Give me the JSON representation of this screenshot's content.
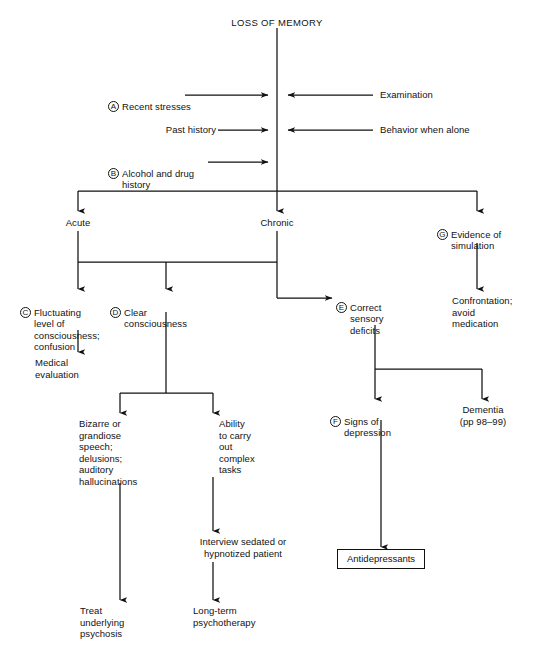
{
  "diagram": {
    "title": "LOSS OF MEMORY",
    "type": "clinical-decision-flowchart",
    "nodes": {
      "root": {
        "label": "LOSS OF MEMORY"
      },
      "a_recent_stresses": {
        "key": "A",
        "label": "Recent stresses"
      },
      "examination": {
        "label": "Examination"
      },
      "past_history": {
        "label": "Past history"
      },
      "behavior_when_alone": {
        "label": "Behavior when alone"
      },
      "b_alcohol_drug": {
        "key": "B",
        "label": "Alcohol and drug\nhistory"
      },
      "acute": {
        "label": "Acute"
      },
      "chronic": {
        "label": "Chronic"
      },
      "g_simulation": {
        "key": "G",
        "label": "Evidence of\nsimulation"
      },
      "confrontation": {
        "label": "Confrontation;\navoid\nmedication"
      },
      "c_fluctuating": {
        "key": "C",
        "label": "Fluctuating\nlevel of\nconsciousness;\nconfusion"
      },
      "medical_evaluation": {
        "label": "Medical\nevaluation"
      },
      "d_clear_consciousness": {
        "key": "D",
        "label": "Clear\nconsciousness"
      },
      "e_correct_sensory": {
        "key": "E",
        "label": "Correct\nsensory\ndeficits"
      },
      "bizarre_speech": {
        "label": "Bizarre or\ngrandiose\nspeech;\ndelusions;\nauditory\nhallucinations"
      },
      "ability_complex_tasks": {
        "label": "Ability\nto carry\nout\ncomplex\ntasks"
      },
      "f_signs_depression": {
        "key": "F",
        "label": "Signs of\ndepression"
      },
      "dementia": {
        "label": "Dementia\n(pp 98–99)"
      },
      "interview_sedated": {
        "label": "Interview sedated or\nhypnotized patient"
      },
      "treat_underlying": {
        "label": "Treat\nunderlying\npsychosis"
      },
      "long_term_psychotherapy": {
        "label": "Long-term\npsychotherapy"
      },
      "antidepressants": {
        "label": "Antidepressants"
      }
    },
    "colors": {
      "ink": "#111111",
      "background": "#ffffff"
    }
  }
}
